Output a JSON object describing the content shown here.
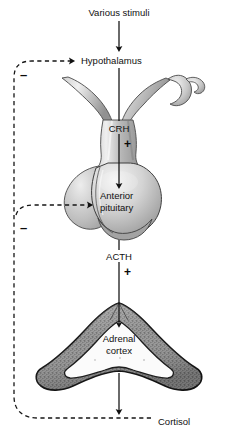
{
  "figure": {
    "type": "biological-pathway-diagram",
    "background_color": "#ffffff",
    "line_color": "#101010"
  },
  "nodes": {
    "stimuli": {
      "label": "Various stimuli",
      "x": 119,
      "y": 13
    },
    "hypothalamus": {
      "label": "Hypothalamus",
      "x": 119,
      "y": 61
    },
    "crh": {
      "label": "CRH",
      "x": 119,
      "y": 129
    },
    "anterior_pituitary": {
      "label_line1": "Anterior",
      "label_line2": "pituitary",
      "x": 100,
      "y": 192
    },
    "acth": {
      "label": "ACTH",
      "x": 119,
      "y": 257
    },
    "adrenal_cortex": {
      "label_line1": "Adrenal",
      "label_line2": "cortex",
      "x": 119,
      "y": 340
    },
    "cortisol": {
      "label": "Cortisol",
      "x": 124,
      "y": 422
    }
  },
  "signs": {
    "plus_crh_to_pituitary": {
      "symbol": "+",
      "x": 124,
      "y": 140
    },
    "plus_acth_to_adrenal": {
      "symbol": "+",
      "x": 124,
      "y": 268
    },
    "minus_cortisol_to_hypothalamus": {
      "symbol": "–",
      "x": 19,
      "y": 70
    },
    "minus_cortisol_to_pituitary": {
      "symbol": "–",
      "x": 19,
      "y": 223
    }
  },
  "arrows": {
    "stimuli_to_hypothalamus": {
      "style": "solid",
      "direction": "down",
      "from": "Various stimuli",
      "to": "Hypothalamus"
    },
    "hypothalamus_to_pituitary": {
      "style": "solid",
      "direction": "down",
      "from": "Hypothalamus",
      "to": "Anterior pituitary",
      "mediator": "CRH",
      "effect": "+"
    },
    "pituitary_to_adrenal": {
      "style": "solid",
      "direction": "down",
      "from": "Anterior pituitary",
      "to": "Adrenal cortex",
      "mediator": "ACTH",
      "effect": "+"
    },
    "adrenal_to_cortisol": {
      "style": "solid",
      "direction": "down",
      "from": "Adrenal cortex",
      "to": "Cortisol"
    },
    "cortisol_to_hypothalamus_feedback": {
      "style": "dashed",
      "direction": "up-left-then-right",
      "from": "Cortisol",
      "to": "Hypothalamus",
      "effect": "–"
    },
    "cortisol_to_pituitary_feedback": {
      "style": "dashed",
      "direction": "up-left-then-right",
      "from": "Cortisol",
      "to": "Anterior pituitary",
      "effect": "–"
    }
  },
  "illustrations": {
    "hypothalamus_infundibulum": {
      "name": "hypothalamus-infundibulum-illustration",
      "fill_light": "#ececec",
      "fill_mid": "#a8a8a8",
      "fill_dark": "#8d8d8d",
      "outline": "#3a3a3a"
    },
    "pituitary_gland": {
      "name": "pituitary-gland-illustration",
      "fill_light": "#eeeeee",
      "fill_mid": "#b0b0b0",
      "fill_dark": "#9a9a9a",
      "outline": "#3a3a3a"
    },
    "adrenal_gland": {
      "name": "adrenal-gland-illustration",
      "cortex_fill": "#8f8f8f",
      "medulla_fill": "#f7f7f7",
      "outline": "#141414",
      "texture": "stippled"
    }
  }
}
